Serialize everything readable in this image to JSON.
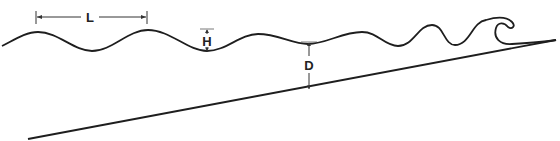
{
  "diagram": {
    "type": "wave-shoaling-schematic",
    "labels": {
      "wavelength": "L",
      "wave_height": "H",
      "water_depth": "D"
    },
    "colors": {
      "line": "#1e1e1e",
      "dimension": "#333333",
      "background": "#ffffff"
    },
    "elements": [
      {
        "name": "water-surface-wave",
        "description": "Wave profile whose waves steepen toward the shore and break at the right"
      },
      {
        "name": "sea-floor",
        "description": "Sloping bottom line rising from lower left to upper right"
      },
      {
        "name": "wavelength-dimension",
        "label": "L",
        "description": "Horizontal dimension between two crests"
      },
      {
        "name": "wave-height-dimension",
        "label": "H",
        "description": "Vertical dimension from trough to crest level"
      },
      {
        "name": "water-depth-dimension",
        "label": "D",
        "description": "Vertical dimension from trough to sea floor"
      }
    ]
  }
}
